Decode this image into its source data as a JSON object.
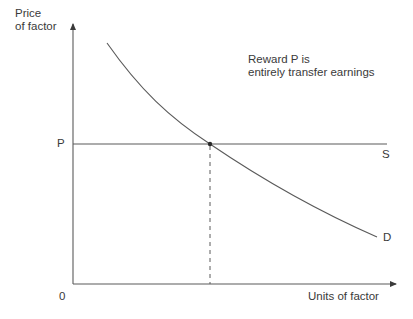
{
  "diagram": {
    "y_axis": {
      "label_line1": "Price",
      "label_line2": "of factor"
    },
    "x_axis": {
      "label": "Units of factor"
    },
    "origin_label": "0",
    "price_level_label": "P",
    "supply_curve_label": "S",
    "demand_curve_label": "D",
    "annotation": {
      "line1": "Reward P is",
      "line2": "entirely transfer earnings"
    },
    "colors": {
      "axis": "#4a4a4a",
      "curve": "#555555",
      "text": "#3a3a3a"
    }
  }
}
